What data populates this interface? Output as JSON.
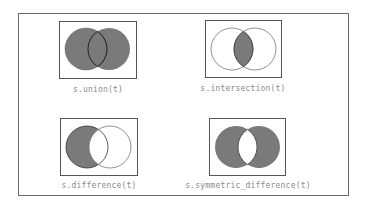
{
  "diagram": {
    "colors": {
      "fill": "#7a7a7a",
      "stroke": "#333333",
      "box": "#555555",
      "label": "#8a8a8a"
    },
    "panels": [
      {
        "id": "union",
        "label": "s.union(t)",
        "shaded": "both"
      },
      {
        "id": "intersection",
        "label": "s.intersection(t)",
        "shaded": "overlap"
      },
      {
        "id": "difference",
        "label": "s.difference(t)",
        "shaded": "left-only"
      },
      {
        "id": "symmetric_difference",
        "label": "s.symmetric_difference(t)",
        "shaded": "non-overlap"
      }
    ]
  }
}
